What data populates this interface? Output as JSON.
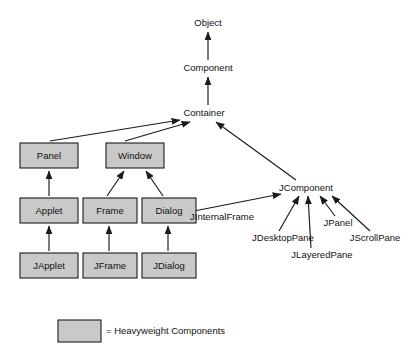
{
  "diagram": {
    "type": "class-hierarchy",
    "colors": {
      "heavyweight_fill": "#c9c9c9",
      "stroke": "#1a1a1a",
      "text": "#111111",
      "background": "#ffffff"
    },
    "plain_nodes": [
      {
        "id": "object",
        "label": "Object",
        "x": 208,
        "y": 23
      },
      {
        "id": "component",
        "label": "Component",
        "x": 208,
        "y": 68
      },
      {
        "id": "container",
        "label": "Container",
        "x": 204,
        "y": 113
      },
      {
        "id": "jcomponent",
        "label": "JComponent",
        "x": 306,
        "y": 188
      },
      {
        "id": "jinternalframe",
        "label": "JInternalFrame",
        "x": 222,
        "y": 217
      },
      {
        "id": "jpanel",
        "label": "JPanel",
        "x": 338,
        "y": 223
      },
      {
        "id": "jdesktoppane",
        "label": "JDesktopPane",
        "x": 283,
        "y": 238
      },
      {
        "id": "jscrollpane",
        "label": "JScrollPane",
        "x": 375,
        "y": 238
      },
      {
        "id": "jlayeredpane",
        "label": "JLayeredPane",
        "x": 322,
        "y": 255
      }
    ],
    "boxed_nodes": [
      {
        "id": "panel",
        "label": "Panel",
        "x": 20,
        "y": 143,
        "w": 58,
        "h": 25
      },
      {
        "id": "window",
        "label": "Window",
        "x": 106,
        "y": 143,
        "w": 58,
        "h": 25
      },
      {
        "id": "applet",
        "label": "Applet",
        "x": 20,
        "y": 198,
        "w": 58,
        "h": 25
      },
      {
        "id": "frame",
        "label": "Frame",
        "x": 83,
        "y": 198,
        "w": 54,
        "h": 25
      },
      {
        "id": "dialog",
        "label": "Dialog",
        "x": 142,
        "y": 198,
        "w": 54,
        "h": 25
      },
      {
        "id": "japplet",
        "label": "JApplet",
        "x": 20,
        "y": 253,
        "w": 58,
        "h": 25
      },
      {
        "id": "jframe",
        "label": "JFrame",
        "x": 83,
        "y": 253,
        "w": 54,
        "h": 25
      },
      {
        "id": "jdialog",
        "label": "JDialog",
        "x": 142,
        "y": 253,
        "w": 54,
        "h": 25
      }
    ],
    "edges": [
      {
        "id": "component-to-object",
        "from": "Component",
        "to": "Object",
        "x1": 208,
        "y1": 60,
        "x2": 208,
        "y2": 32
      },
      {
        "id": "container-to-component",
        "from": "Container",
        "to": "Component",
        "x1": 208,
        "y1": 105,
        "x2": 208,
        "y2": 77
      },
      {
        "id": "panel-to-container",
        "from": "Panel",
        "to": "Container",
        "x1": 50,
        "y1": 141,
        "x2": 180,
        "y2": 120
      },
      {
        "id": "window-to-container",
        "from": "Window",
        "to": "Container",
        "x1": 125,
        "y1": 141,
        "x2": 190,
        "y2": 122
      },
      {
        "id": "jcomponent-to-container",
        "from": "JComponent",
        "to": "Container",
        "x1": 296,
        "y1": 180,
        "x2": 216,
        "y2": 122
      },
      {
        "id": "applet-to-panel",
        "from": "Applet",
        "to": "Panel",
        "x1": 49,
        "y1": 196,
        "x2": 49,
        "y2": 171
      },
      {
        "id": "japplet-to-applet",
        "from": "JApplet",
        "to": "Applet",
        "x1": 49,
        "y1": 251,
        "x2": 49,
        "y2": 226
      },
      {
        "id": "frame-to-window",
        "from": "Frame",
        "to": "Window",
        "x1": 107,
        "y1": 196,
        "x2": 124,
        "y2": 171
      },
      {
        "id": "dialog-to-window",
        "from": "Dialog",
        "to": "Window",
        "x1": 163,
        "y1": 196,
        "x2": 146,
        "y2": 171
      },
      {
        "id": "jframe-to-frame",
        "from": "JFrame",
        "to": "Frame",
        "x1": 109,
        "y1": 251,
        "x2": 109,
        "y2": 226
      },
      {
        "id": "jdialog-to-dialog",
        "from": "JDialog",
        "to": "Dialog",
        "x1": 168,
        "y1": 251,
        "x2": 168,
        "y2": 226
      },
      {
        "id": "jinternalframe-to-jcomponent",
        "from": "JInternalFrame",
        "to": "JComponent",
        "x1": 194,
        "y1": 211,
        "x2": 281,
        "y2": 194
      },
      {
        "id": "jdesktoppane-to-jcomponent",
        "from": "JDesktopPane",
        "to": "JComponent",
        "x1": 279,
        "y1": 231,
        "x2": 299,
        "y2": 196
      },
      {
        "id": "jlayeredpane-to-jcomponent",
        "from": "JLayeredPane",
        "to": "JComponent",
        "x1": 311,
        "y1": 248,
        "x2": 308,
        "y2": 196
      },
      {
        "id": "jpanel-to-jcomponent",
        "from": "JPanel",
        "to": "JComponent",
        "x1": 335,
        "y1": 216,
        "x2": 320,
        "y2": 196
      },
      {
        "id": "jscrollpane-to-jcomponent",
        "from": "JScrollPane",
        "to": "JComponent",
        "x1": 370,
        "y1": 231,
        "x2": 332,
        "y2": 196
      }
    ],
    "legend": {
      "swatch_x": 58,
      "swatch_y": 320,
      "swatch_w": 43,
      "swatch_h": 22,
      "label": "= Heavyweight Components",
      "label_x": 106,
      "label_y": 331
    }
  }
}
